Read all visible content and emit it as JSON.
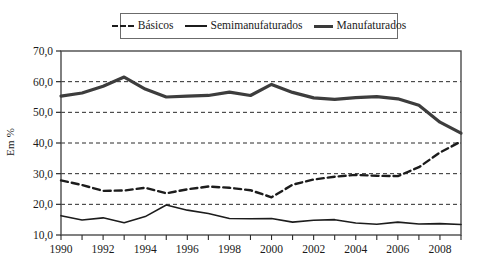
{
  "chart_data": {
    "type": "line",
    "title": "",
    "subtitle": "",
    "xlabel": "",
    "ylabel": "Em %",
    "xlim": [
      1990,
      2009
    ],
    "ylim": [
      10.0,
      70.0
    ],
    "grid": true,
    "legend_position": "top-center",
    "y_tick_labels": [
      "70,0",
      "60,0",
      "50,0",
      "40,0",
      "30,0",
      "20,0",
      "10,0"
    ],
    "y_ticks": [
      70.0,
      60.0,
      50.0,
      40.0,
      30.0,
      20.0,
      10.0
    ],
    "x_tick_labels": [
      "1990",
      "1992",
      "1994",
      "1996",
      "1998",
      "2000",
      "2002",
      "2004",
      "2006",
      "2008"
    ],
    "x_ticks": [
      1990,
      1992,
      1994,
      1996,
      1998,
      2000,
      2002,
      2004,
      2006,
      2008
    ],
    "x_minor_ticks": [
      1990,
      1991,
      1992,
      1993,
      1994,
      1995,
      1996,
      1997,
      1998,
      1999,
      2000,
      2001,
      2002,
      2003,
      2004,
      2005,
      2006,
      2007,
      2008,
      2009
    ],
    "x": [
      1990,
      1991,
      1992,
      1993,
      1994,
      1995,
      1996,
      1997,
      1998,
      1999,
      2000,
      2001,
      2002,
      2003,
      2004,
      2005,
      2006,
      2007,
      2008,
      2009
    ],
    "series": [
      {
        "name": "Básicos",
        "style": "dashed",
        "color": "#1c1c1c",
        "width": 2.4,
        "values": [
          27.8,
          26.3,
          24.4,
          24.5,
          25.4,
          23.6,
          24.9,
          25.8,
          25.4,
          24.6,
          22.3,
          26.4,
          28.1,
          29.0,
          29.6,
          29.3,
          29.2,
          32.1,
          36.9,
          40.5
        ]
      },
      {
        "name": "Semimanufaturados",
        "style": "solid",
        "color": "#1c1c1c",
        "width": 1.6,
        "values": [
          16.3,
          14.9,
          15.6,
          14.0,
          16.0,
          19.8,
          18.1,
          17.0,
          15.4,
          15.3,
          15.4,
          14.2,
          14.8,
          15.0,
          13.9,
          13.5,
          14.2,
          13.6,
          13.7,
          13.4
        ]
      },
      {
        "name": "Manufaturados",
        "style": "solid-thick",
        "color": "#3d3d3d",
        "width": 3.2,
        "values": [
          55.3,
          56.3,
          58.5,
          61.5,
          57.6,
          55.0,
          55.3,
          55.5,
          56.6,
          55.5,
          59.1,
          56.5,
          54.7,
          54.2,
          54.8,
          55.1,
          54.4,
          52.3,
          46.8,
          43.2
        ]
      }
    ]
  },
  "legend": {
    "entries": [
      {
        "label": "Básicos",
        "icon": "dashed-line-swatch"
      },
      {
        "label": "Semimanufaturados",
        "icon": "solid-line-swatch"
      },
      {
        "label": "Manufaturados",
        "icon": "thick-line-swatch"
      }
    ]
  },
  "axes": {
    "y_title": "Em %"
  }
}
